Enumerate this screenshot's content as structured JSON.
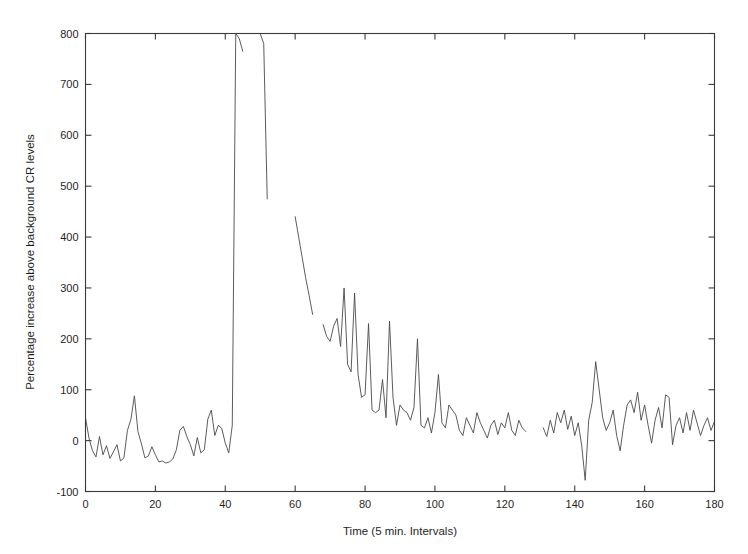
{
  "chart_data": {
    "type": "line",
    "title": "",
    "xlabel": "Time (5 min. Intervals)",
    "ylabel": "Percentage increase above background CR levels",
    "xlim": [
      0,
      180
    ],
    "ylim": [
      -100,
      800
    ],
    "xticks": [
      0,
      20,
      40,
      60,
      80,
      100,
      120,
      140,
      160,
      180
    ],
    "yticks": [
      -100,
      0,
      100,
      200,
      300,
      400,
      500,
      600,
      700,
      800
    ],
    "grid": false,
    "legend": null,
    "legend_position": "none",
    "line_color": "#4a4a4a",
    "background_color": "#ffffff",
    "axis_color": "#3a3a3a",
    "series": [
      {
        "name": "Percentage increase above background CR levels",
        "x": [
          0,
          1,
          2,
          3,
          4,
          5,
          6,
          7,
          8,
          9,
          10,
          11,
          12,
          13,
          14,
          15,
          16,
          17,
          18,
          19,
          20,
          21,
          22,
          23,
          24,
          25,
          26,
          27,
          28,
          29,
          30,
          31,
          32,
          33,
          34,
          35,
          36,
          37,
          38,
          39,
          40,
          41,
          42,
          43
        ],
        "y": [
          45,
          5,
          -20,
          -32,
          8,
          -28,
          -10,
          -35,
          -22,
          -8,
          -40,
          -34,
          20,
          42,
          88,
          18,
          -6,
          -34,
          -30,
          -12,
          -28,
          -42,
          -40,
          -44,
          -42,
          -36,
          -18,
          20,
          28,
          8,
          -8,
          -30,
          6,
          -24,
          -18,
          42,
          60,
          10,
          30,
          24,
          -5,
          -24,
          30,
          800
        ]
      },
      {
        "name": "Spike rise (clipped at top of axis)",
        "x": [
          43,
          44,
          45
        ],
        "y": [
          800,
          790,
          765
        ]
      },
      {
        "name": "Spike second peak and decay",
        "x": [
          50,
          51,
          52
        ],
        "y": [
          800,
          780,
          475
        ]
      },
      {
        "name": "Decay segment",
        "x": [
          60,
          61,
          62,
          63,
          64,
          65
        ],
        "y": [
          440,
          400,
          360,
          320,
          285,
          248
        ]
      },
      {
        "name": "Recovery oscillations",
        "x": [
          68,
          69,
          70,
          71,
          72,
          73,
          74,
          75,
          76,
          77,
          78,
          79,
          80,
          81,
          82,
          83,
          84,
          85,
          86,
          87,
          88,
          89,
          90,
          91,
          92,
          93,
          94,
          95,
          96,
          97,
          98,
          99,
          100,
          101,
          102,
          103,
          104,
          105,
          106,
          107,
          108,
          109,
          110,
          111,
          112,
          113,
          114,
          115,
          116,
          117,
          118,
          119,
          120,
          121,
          122,
          123,
          124,
          125,
          126
        ],
        "y": [
          228,
          205,
          195,
          225,
          240,
          185,
          300,
          150,
          135,
          290,
          130,
          85,
          90,
          230,
          60,
          55,
          60,
          120,
          45,
          235,
          85,
          30,
          70,
          60,
          55,
          40,
          65,
          200,
          30,
          25,
          45,
          15,
          55,
          130,
          35,
          25,
          70,
          60,
          50,
          20,
          10,
          45,
          30,
          15,
          55,
          35,
          20,
          5,
          30,
          40,
          12,
          35,
          25,
          55,
          20,
          10,
          40,
          25,
          18
        ]
      },
      {
        "name": "Late baseline after gap",
        "x": [
          131,
          132,
          133,
          134,
          135,
          136,
          137,
          138,
          139,
          140,
          141,
          142,
          143,
          144,
          145,
          146,
          147,
          148,
          149,
          150,
          151,
          152,
          153,
          154,
          155,
          156,
          157,
          158,
          159,
          160,
          161,
          162,
          163,
          164,
          165,
          166,
          167,
          168,
          169,
          170,
          171,
          172,
          173,
          174,
          175,
          176,
          177,
          178,
          179,
          180
        ],
        "y": [
          25,
          8,
          40,
          15,
          55,
          35,
          60,
          22,
          48,
          10,
          35,
          -10,
          -78,
          40,
          75,
          155,
          100,
          45,
          20,
          35,
          60,
          10,
          -20,
          30,
          70,
          80,
          55,
          95,
          40,
          70,
          30,
          -5,
          40,
          65,
          25,
          90,
          85,
          -8,
          30,
          45,
          15,
          55,
          20,
          60,
          35,
          10,
          30,
          45,
          20,
          38
        ]
      }
    ],
    "annotations": []
  },
  "tick_labels": {
    "y": [
      "800",
      "700",
      "600",
      "500",
      "400",
      "300",
      "200",
      "100",
      "0",
      "-100"
    ],
    "x": [
      "0",
      "20",
      "40",
      "60",
      "80",
      "100",
      "120",
      "140",
      "160",
      "180"
    ]
  },
  "axis_titles": {
    "x": "Time (5 min. Intervals)",
    "y": "Percentage increase above background CR levels"
  }
}
